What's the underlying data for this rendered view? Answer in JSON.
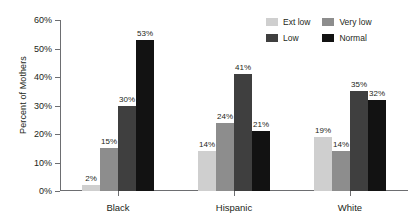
{
  "chart_data": {
    "type": "bar",
    "title": "",
    "xlabel": "",
    "ylabel": "Percent of Mothers",
    "categories": [
      "Black",
      "Hispanic",
      "White"
    ],
    "series": [
      {
        "name": "Ext low",
        "color": "#cfcfcf",
        "values": [
          2,
          14,
          19
        ],
        "labels": [
          "2%",
          "14%",
          "19%"
        ]
      },
      {
        "name": "Very low",
        "color": "#8d8d8d",
        "values": [
          15,
          24,
          14
        ],
        "labels": [
          "15%",
          "24%",
          "14%"
        ]
      },
      {
        "name": "Low",
        "color": "#3f3f3f",
        "values": [
          30,
          41,
          35
        ],
        "labels": [
          "30%",
          "41%",
          "35%"
        ]
      },
      {
        "name": "Normal",
        "color": "#121212",
        "values": [
          53,
          21,
          32
        ],
        "labels": [
          "53%",
          "21%",
          "32%"
        ]
      }
    ],
    "ylim": [
      0,
      60
    ],
    "yticks": [
      0,
      10,
      20,
      30,
      40,
      50,
      60
    ],
    "ytick_labels": [
      "0%",
      "10%",
      "20%",
      "30%",
      "40%",
      "50%",
      "60%"
    ],
    "grid": false,
    "legend_position": "top-right",
    "axis_color": "#6d6e71"
  },
  "legend": {
    "entries": [
      {
        "label": "Ext low",
        "color": "#cfcfcf"
      },
      {
        "label": "Very low",
        "color": "#8d8d8d"
      },
      {
        "label": "Low",
        "color": "#3f3f3f"
      },
      {
        "label": "Normal",
        "color": "#121212"
      }
    ]
  }
}
